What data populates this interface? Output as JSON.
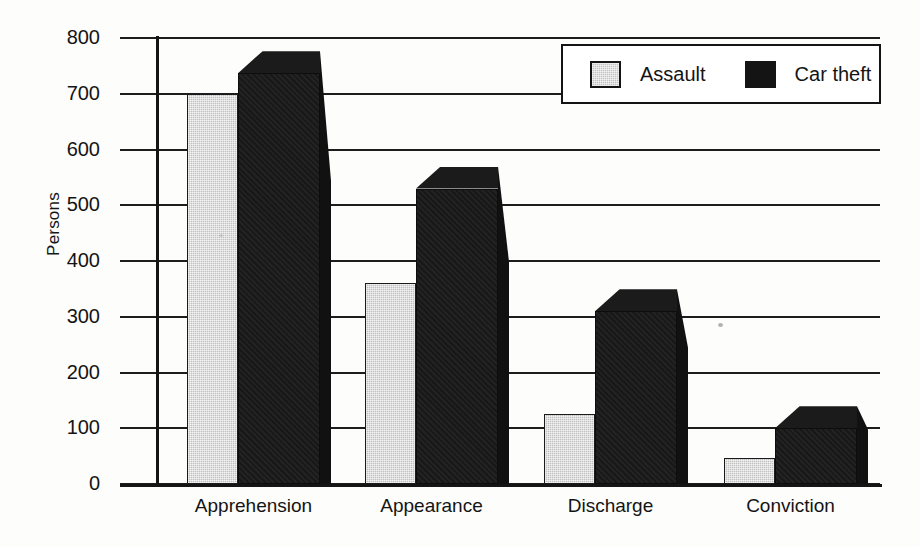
{
  "chart_data": {
    "type": "bar",
    "title": "",
    "xlabel": "",
    "ylabel": "Persons",
    "ylim": [
      0,
      800
    ],
    "ytick_step": 100,
    "yticks": [
      800,
      700,
      600,
      500,
      400,
      300,
      200,
      100,
      0
    ],
    "grid": true,
    "legend_position": "top-right",
    "categories": [
      "Apprehension",
      "Appearance",
      "Discharge",
      "Conviction"
    ],
    "series": [
      {
        "name": "Assault",
        "color": "#c0c0c0",
        "values": [
          700,
          360,
          125,
          47
        ]
      },
      {
        "name": "Car theft",
        "color": "#181818",
        "values": [
          737,
          530,
          310,
          100
        ]
      }
    ]
  },
  "legend": {
    "items": [
      {
        "label": "Assault",
        "swatch": "gray-swatch"
      },
      {
        "label": "Car theft",
        "swatch": "black-swatch"
      }
    ]
  },
  "axes": {
    "y_axis_label": "Persons",
    "y_tick_labels": [
      "800",
      "700",
      "600",
      "500",
      "400",
      "300",
      "200",
      "100",
      "0"
    ],
    "x_tick_labels": [
      "Apprehension",
      "Appearance",
      "Discharge",
      "Conviction"
    ]
  }
}
